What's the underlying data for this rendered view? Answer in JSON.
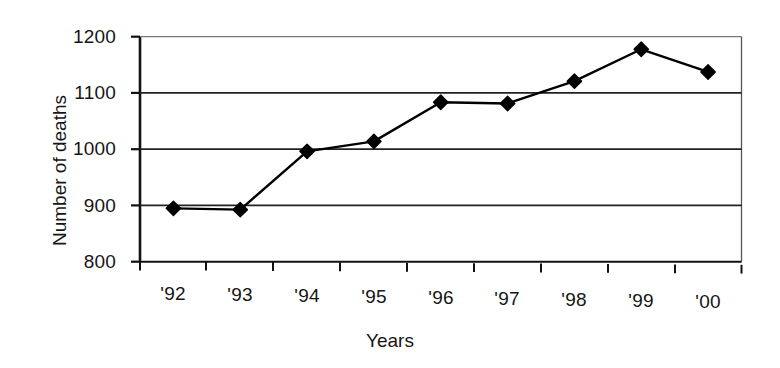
{
  "chart_data": {
    "type": "line",
    "title": "",
    "xlabel": "Years",
    "ylabel": "Number of deaths",
    "categories": [
      "'92",
      "'93",
      "'94",
      "'95",
      "'96",
      "'97",
      "'98",
      "'99",
      "'00"
    ],
    "values": [
      895,
      893,
      997,
      1015,
      1085,
      1083,
      1123,
      1180,
      1140
    ],
    "series": [
      {
        "name": "Number of deaths",
        "values": [
          895,
          893,
          997,
          1015,
          1085,
          1083,
          1123,
          1180,
          1140
        ]
      }
    ],
    "ylim": [
      800,
      1200
    ],
    "yticks": [
      800,
      900,
      1000,
      1100,
      1200
    ],
    "ytick_labels": [
      "800",
      "900",
      "1000",
      "1100",
      "1200"
    ],
    "xtick_labels": [
      "'92",
      "'93",
      "'94",
      "'95",
      "'96",
      "'97",
      "'98",
      "'99",
      "'00"
    ],
    "grid": "horizontal",
    "legend": "none",
    "marker": "filled-diamond",
    "line_color": "#000000",
    "marker_color": "#000000",
    "grid_color": "#333333",
    "background_color": "#ffffff"
  },
  "axes": {
    "y_title": "Number of deaths",
    "x_title": "Years"
  }
}
